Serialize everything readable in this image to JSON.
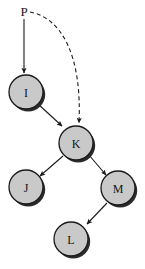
{
  "diagram": {
    "background_color": "#ffffff",
    "node_fill_color": "#c9c9c9",
    "node_stroke_color": "#1a1a1a",
    "node_shadow_color": "#2b2b2b",
    "edge_color": "#1a1a1a",
    "label_color": "#151515",
    "node_radius": 17,
    "free_labels": [
      {
        "id": "P",
        "text": "P",
        "x": 24,
        "y": 16,
        "font_size": 13
      }
    ],
    "nodes": [
      {
        "id": "I",
        "label": "I",
        "cx": 26,
        "cy": 92,
        "r": 17,
        "font_size": 12
      },
      {
        "id": "K",
        "label": "K",
        "cx": 76,
        "cy": 143,
        "r": 17,
        "font_size": 12
      },
      {
        "id": "J",
        "label": "J",
        "cx": 26,
        "cy": 187,
        "r": 17,
        "font_size": 12
      },
      {
        "id": "M",
        "label": "M",
        "cx": 118,
        "cy": 188,
        "r": 17,
        "font_size": 12
      },
      {
        "id": "L",
        "label": "L",
        "cx": 71,
        "cy": 239,
        "r": 17,
        "font_size": 12
      }
    ],
    "edges": [
      {
        "id": "P-I",
        "from": "P",
        "to": "I",
        "style": "solid",
        "path": "M 24,19 L 24,73"
      },
      {
        "id": "P-K",
        "from": "P",
        "to": "K",
        "style": "dashed",
        "path": "M 30,12 C 62,18 82,56 79,123",
        "dash": "4,3"
      },
      {
        "id": "I-K",
        "from": "I",
        "to": "K",
        "style": "solid",
        "path": "M 38,104 L 62,126"
      },
      {
        "id": "K-J",
        "from": "K",
        "to": "J",
        "style": "solid",
        "path": "M 63,156 L 40,176"
      },
      {
        "id": "K-M",
        "from": "K",
        "to": "M",
        "style": "solid",
        "path": "M 89,155 L 106,175"
      },
      {
        "id": "M-L",
        "from": "M",
        "to": "L",
        "style": "solid",
        "path": "M 107,203 L 87,224"
      }
    ]
  }
}
